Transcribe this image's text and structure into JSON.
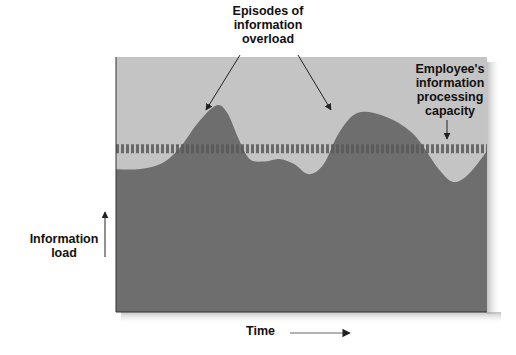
{
  "labels": {
    "episodes": "Episodes of information overload",
    "episodes_lines": [
      "Episodes of",
      "information",
      "overload"
    ],
    "capacity_lines": [
      "Employee's",
      "information",
      "processing",
      "capacity"
    ],
    "y_axis_lines": [
      "Information",
      "load"
    ],
    "x_axis": "Time"
  },
  "colors": {
    "background": "#ffffff",
    "panel": "#c4c4c4",
    "load_area": "#6e6e6e",
    "capacity_dash": "#5a5a5a",
    "text": "#111111",
    "arrow": "#222222"
  },
  "chart_data": {
    "type": "area",
    "title": "Episodes of information overload",
    "xlabel": "Time",
    "ylabel": "Information load",
    "x_range": [
      0,
      100
    ],
    "y_range": [
      0,
      100
    ],
    "capacity_level": 64,
    "series": [
      {
        "name": "Information load",
        "x": [
          0,
          6,
          12,
          17,
          22,
          27,
          30,
          33,
          36,
          40,
          44,
          48,
          52,
          56,
          60,
          65,
          72,
          80,
          87,
          91,
          95,
          100
        ],
        "y": [
          56,
          56,
          58,
          64,
          74,
          81,
          78,
          68,
          60,
          59,
          60,
          58,
          54,
          58,
          70,
          78,
          77,
          70,
          56,
          51,
          54,
          63
        ]
      }
    ],
    "annotations": [
      {
        "text": "Episodes of information overload",
        "targets_x": [
          24,
          58
        ]
      },
      {
        "text": "Employee's information processing capacity",
        "target": "capacity_line"
      }
    ]
  }
}
